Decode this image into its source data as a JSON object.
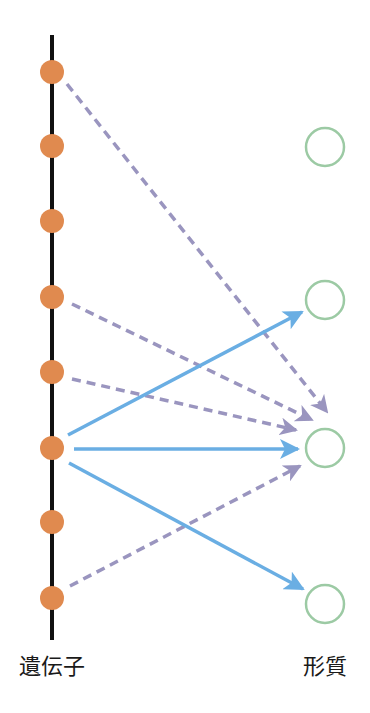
{
  "colors": {
    "axis": "#111111",
    "gene": "#e08a4f",
    "trait_stroke": "#9ccaa4",
    "solid_arrow": "#6aaee3",
    "dashed_arrow": "#9a95bf",
    "background": "#ffffff"
  },
  "labels": {
    "genes": "遺伝子",
    "traits": "形質"
  },
  "axis": {
    "x": 52,
    "y1": 35,
    "y2": 640
  },
  "genes": [
    {
      "id": "g1",
      "x": 52,
      "y": 72
    },
    {
      "id": "g2",
      "x": 52,
      "y": 146
    },
    {
      "id": "g3",
      "x": 52,
      "y": 221
    },
    {
      "id": "g4",
      "x": 52,
      "y": 297
    },
    {
      "id": "g5",
      "x": 52,
      "y": 372
    },
    {
      "id": "g6",
      "x": 52,
      "y": 448
    },
    {
      "id": "g7",
      "x": 52,
      "y": 522
    },
    {
      "id": "g8",
      "x": 52,
      "y": 598
    }
  ],
  "traits": [
    {
      "id": "t1",
      "x": 325,
      "y": 147
    },
    {
      "id": "t2",
      "x": 325,
      "y": 300
    },
    {
      "id": "t3",
      "x": 325,
      "y": 448
    },
    {
      "id": "t4",
      "x": 325,
      "y": 604
    }
  ],
  "arrows": [
    {
      "from": "g1",
      "x1": 67,
      "y1": 84,
      "x2": 327,
      "y2": 412,
      "style": "dashed"
    },
    {
      "from": "g4",
      "x1": 72,
      "y1": 304,
      "x2": 312,
      "y2": 420,
      "style": "dashed"
    },
    {
      "from": "g5",
      "x1": 72,
      "y1": 379,
      "x2": 296,
      "y2": 430,
      "style": "dashed"
    },
    {
      "from": "g8",
      "x1": 70,
      "y1": 586,
      "x2": 300,
      "y2": 466,
      "style": "dashed"
    },
    {
      "from": "g6",
      "x1": 68,
      "y1": 435,
      "x2": 302,
      "y2": 312,
      "style": "solid"
    },
    {
      "from": "g6",
      "x1": 74,
      "y1": 449,
      "x2": 298,
      "y2": 449,
      "style": "solid"
    },
    {
      "from": "g6",
      "x1": 69,
      "y1": 463,
      "x2": 303,
      "y2": 589,
      "style": "solid"
    }
  ]
}
